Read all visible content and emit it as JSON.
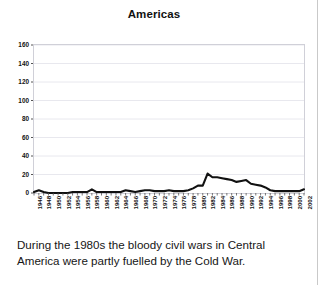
{
  "figure": {
    "title": "Americas",
    "caption": "During the 1980s the bloody civil wars in Central America were partly fuelled by the Cold War."
  },
  "colors": {
    "line": "#111111",
    "grid": "#e8e8ee",
    "plot_border": "#d0d0d8",
    "axis_text": "#121212",
    "gutter_rule": "#c9c9c9",
    "background": "#ffffff"
  },
  "chart_data": {
    "type": "line",
    "title": "Americas",
    "xlabel": "",
    "ylabel": "",
    "ylim": [
      0,
      160
    ],
    "yticks": [
      0,
      20,
      40,
      60,
      80,
      100,
      120,
      140,
      160
    ],
    "xlim": [
      1946,
      2002
    ],
    "grid": true,
    "legend": null,
    "xtick_labels": [
      "1946",
      "1948",
      "1950",
      "1952",
      "1954",
      "1956",
      "1958",
      "1960",
      "1962",
      "1964",
      "1966",
      "1968",
      "1970",
      "1972",
      "1974",
      "1976",
      "1978",
      "1980",
      "1982",
      "1984",
      "1986",
      "1988",
      "1990",
      "1992",
      "1994",
      "1996",
      "1998",
      "2000",
      "2002"
    ],
    "x": [
      1946,
      1947,
      1948,
      1949,
      1950,
      1951,
      1952,
      1953,
      1954,
      1955,
      1956,
      1957,
      1958,
      1959,
      1960,
      1961,
      1962,
      1963,
      1964,
      1965,
      1966,
      1967,
      1968,
      1969,
      1970,
      1971,
      1972,
      1973,
      1974,
      1975,
      1976,
      1977,
      1978,
      1979,
      1980,
      1981,
      1982,
      1983,
      1984,
      1985,
      1986,
      1987,
      1988,
      1989,
      1990,
      1991,
      1992,
      1993,
      1994,
      1995,
      1996,
      1997,
      1998,
      1999,
      2000,
      2001,
      2002
    ],
    "values": [
      1,
      3,
      1,
      0,
      0,
      0,
      0,
      0,
      1,
      1,
      1,
      1,
      4,
      1,
      1,
      1,
      1,
      1,
      1,
      3,
      2,
      1,
      2,
      3,
      3,
      2,
      2,
      2,
      3,
      2,
      2,
      2,
      3,
      5,
      8,
      8,
      21,
      17,
      17,
      16,
      15,
      14,
      12,
      13,
      14,
      10,
      9,
      8,
      6,
      3,
      2,
      2,
      2,
      2,
      2,
      2,
      4
    ],
    "series_name": "Americas"
  }
}
